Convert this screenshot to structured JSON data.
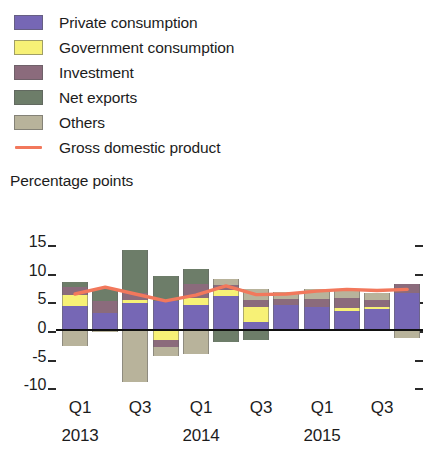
{
  "legend": {
    "items": [
      {
        "label": "Private consumption",
        "color": "#7667b5",
        "icon": "color-swatch"
      },
      {
        "label": "Government consumption",
        "color": "#f7f176",
        "icon": "color-swatch"
      },
      {
        "label": "Investment",
        "color": "#8b6b7c",
        "icon": "color-swatch"
      },
      {
        "label": "Net exports",
        "color": "#6d7d69",
        "icon": "color-swatch"
      },
      {
        "label": "Others",
        "color": "#b8b39b",
        "icon": "color-swatch"
      },
      {
        "label": "Gross domestic product",
        "color": "#f2785c",
        "icon": "line-swatch"
      }
    ]
  },
  "axis_title": "Percentage points",
  "yticks": [
    "15",
    "10",
    "5",
    "0",
    "-5",
    "-10"
  ],
  "xaxis": {
    "quarters": [
      "Q1",
      "Q3",
      "Q1",
      "Q3",
      "Q1",
      "Q3"
    ],
    "years": [
      "2013",
      "2014",
      "2015"
    ]
  },
  "chart_data": {
    "type": "bar",
    "title": "",
    "subtitle": "",
    "xlabel": "",
    "ylabel": "Percentage points",
    "ylim": [
      -10,
      15
    ],
    "ytick_values": [
      15,
      10,
      5,
      0,
      -5,
      -10
    ],
    "grid": false,
    "legend_position": "top-left",
    "stacked": true,
    "categories": [
      "Q1 2013",
      "Q2 2013",
      "Q3 2013",
      "Q4 2013",
      "Q1 2014",
      "Q2 2014",
      "Q3 2014",
      "Q4 2014",
      "Q1 2015",
      "Q2 2015",
      "Q3 2015",
      "Q4 2015"
    ],
    "series": [
      {
        "name": "Private consumption",
        "color": "#7667b5",
        "values": [
          4.0,
          2.8,
          4.5,
          4.9,
          4.2,
          5.7,
          1.3,
          4.2,
          3.8,
          3.2,
          3.5,
          6.3
        ]
      },
      {
        "name": "Government consumption",
        "color": "#f7f176",
        "values": [
          2.0,
          0.0,
          0.5,
          -1.9,
          1.2,
          1.1,
          2.6,
          0.0,
          0.0,
          0.4,
          0.4,
          0.0
        ]
      },
      {
        "name": "Investment",
        "color": "#8b6b7c",
        "values": [
          1.4,
          2.0,
          1.3,
          -1.3,
          2.4,
          0.9,
          1.1,
          1.0,
          1.5,
          1.8,
          1.2,
          1.6
        ]
      },
      {
        "name": "Net exports",
        "color": "#6d7d69",
        "values": [
          0.8,
          2.2,
          7.5,
          4.4,
          2.6,
          -2.3,
          -2.0,
          0.0,
          0.0,
          0.0,
          0.0,
          0.0
        ]
      },
      {
        "name": "Others",
        "color": "#b8b39b",
        "values": [
          -3.0,
          -0.5,
          -9.3,
          -1.5,
          -4.3,
          1.0,
          1.9,
          1.3,
          1.7,
          1.6,
          1.2,
          -1.5
        ]
      }
    ],
    "line_series": {
      "name": "Gross domestic product",
      "color": "#f2785c",
      "values": [
        6.1,
        7.3,
        6.1,
        4.9,
        5.9,
        7.5,
        6.0,
        6.1,
        6.6,
        6.9,
        6.7,
        6.9
      ]
    }
  }
}
